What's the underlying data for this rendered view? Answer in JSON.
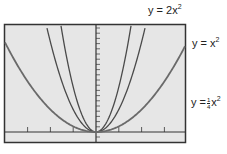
{
  "chart_data": {
    "type": "line",
    "title": "",
    "xlabel": "",
    "ylabel": "",
    "xlim": [
      -4,
      4
    ],
    "ylim": [
      -0.5,
      4.7
    ],
    "grid": false,
    "x_ticks": [
      -3,
      -2,
      -1,
      0,
      1,
      2,
      3
    ],
    "y_ticks_count": 20,
    "series": [
      {
        "name": "y = 2x^2",
        "label_prefix": "y = 2x",
        "label_exp": "2",
        "coef": 2,
        "color": "#4a4a4a"
      },
      {
        "name": "y = x^2",
        "label_prefix": "y = x",
        "label_exp": "2",
        "coef": 1,
        "color": "#4a4a4a"
      },
      {
        "name": "y = 1/4 x^2",
        "label_prefix": "y =",
        "label_num": "1",
        "label_den": "4",
        "label_var": "x",
        "label_exp": "2",
        "coef": 0.25,
        "color": "#6a6a6a"
      }
    ],
    "legend_position": "right, inline labels"
  },
  "colors": {
    "plot_background": "#e6e6e6",
    "frame": "#333333",
    "axis": "#333333",
    "curve": "#4a4a4a"
  }
}
